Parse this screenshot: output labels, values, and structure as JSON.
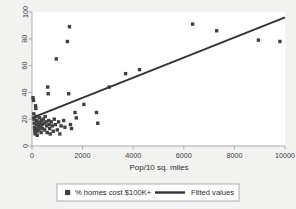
{
  "figure": {
    "background_color": "#f2f2f0",
    "plot_background_color": "#ffffff",
    "marker_color": "#404040",
    "line_color": "#333333",
    "axis_color": "#9a9a9a"
  },
  "chart_data": {
    "type": "scatter",
    "title": "",
    "xlabel": "Pop/10 sq. miles",
    "ylabel": "",
    "xlim": [
      0,
      10000
    ],
    "ylim": [
      0,
      100
    ],
    "xticks": [
      0,
      2000,
      4000,
      6000,
      8000,
      10000
    ],
    "yticks": [
      0,
      20,
      40,
      60,
      80,
      100
    ],
    "xtick_labels": [
      "0",
      "2000",
      "4000",
      "6000",
      "8000",
      "10000"
    ],
    "ytick_labels": [
      "0",
      "20",
      "40",
      "60",
      "80",
      "100"
    ],
    "grid": false,
    "legend_position": "below",
    "legend": [
      {
        "label": "% homes cost $100K+",
        "marker": "square",
        "color": "#404040"
      },
      {
        "label": "Fitted values",
        "marker": "line",
        "color": "#333333"
      }
    ],
    "series": [
      {
        "name": "% homes cost $100K+",
        "type": "scatter",
        "marker": "square",
        "points": [
          [
            40,
            36
          ],
          [
            60,
            34
          ],
          [
            70,
            24
          ],
          [
            80,
            20
          ],
          [
            90,
            17
          ],
          [
            100,
            14
          ],
          [
            110,
            12
          ],
          [
            120,
            10
          ],
          [
            130,
            9
          ],
          [
            140,
            30
          ],
          [
            150,
            28
          ],
          [
            160,
            22
          ],
          [
            170,
            19
          ],
          [
            180,
            16
          ],
          [
            190,
            13
          ],
          [
            200,
            11
          ],
          [
            210,
            8
          ],
          [
            240,
            18
          ],
          [
            260,
            15
          ],
          [
            280,
            12
          ],
          [
            300,
            21
          ],
          [
            320,
            17
          ],
          [
            340,
            14
          ],
          [
            360,
            10
          ],
          [
            380,
            19
          ],
          [
            400,
            16
          ],
          [
            420,
            13
          ],
          [
            450,
            20
          ],
          [
            480,
            17
          ],
          [
            500,
            12
          ],
          [
            520,
            22
          ],
          [
            560,
            18
          ],
          [
            580,
            15
          ],
          [
            600,
            10
          ],
          [
            620,
            44
          ],
          [
            640,
            39
          ],
          [
            660,
            19
          ],
          [
            680,
            16
          ],
          [
            700,
            13
          ],
          [
            720,
            9
          ],
          [
            760,
            18
          ],
          [
            800,
            15
          ],
          [
            840,
            11
          ],
          [
            880,
            20
          ],
          [
            920,
            16
          ],
          [
            960,
            65
          ],
          [
            1000,
            12
          ],
          [
            1050,
            18
          ],
          [
            1100,
            9
          ],
          [
            1150,
            15
          ],
          [
            1250,
            19
          ],
          [
            1300,
            14
          ],
          [
            1400,
            78
          ],
          [
            1450,
            39
          ],
          [
            1480,
            89
          ],
          [
            1520,
            16
          ],
          [
            1560,
            13
          ],
          [
            1700,
            25
          ],
          [
            1750,
            21
          ],
          [
            2050,
            31
          ],
          [
            2550,
            25
          ],
          [
            2600,
            17
          ],
          [
            3050,
            44
          ],
          [
            3700,
            54
          ],
          [
            4250,
            57
          ],
          [
            6350,
            91
          ],
          [
            7300,
            86
          ],
          [
            8950,
            79
          ],
          [
            9800,
            78
          ]
        ]
      },
      {
        "name": "Fitted values",
        "type": "line",
        "points": [
          [
            0,
            21
          ],
          [
            10000,
            96
          ]
        ]
      }
    ]
  }
}
